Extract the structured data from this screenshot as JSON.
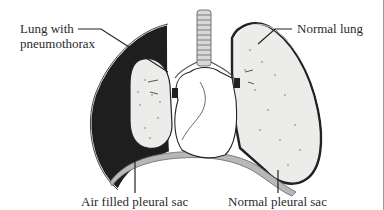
{
  "diagram": {
    "labels": {
      "lung_with_pneumothorax_line1": "Lung with",
      "lung_with_pneumothorax_line2": "pneumothorax",
      "normal_lung": "Normal lung",
      "air_filled_pleural_sac": "Air filled pleural sac",
      "normal_pleural_sac": "Normal pleural sac"
    },
    "colors": {
      "background": "#ffffff",
      "air_space": "#1e1e1e",
      "lung_tissue": "#ececea",
      "heart": "#ffffff",
      "diaphragm": "#b8b8b8",
      "outline": "#222222",
      "text": "#2a2a2a"
    }
  }
}
